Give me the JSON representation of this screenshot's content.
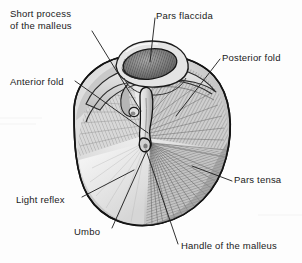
{
  "figure": {
    "background_color": "#fdfdfd",
    "ink_color": "#1a1a1a",
    "width": 302,
    "height": 263
  },
  "labels": [
    {
      "id": "short-process-of-the-malleus",
      "text": "Short process\nof the malleus",
      "x": 10,
      "y": 8,
      "lines": 2
    },
    {
      "id": "pars-flaccida",
      "text": "Pars flaccida",
      "x": 156,
      "y": 10,
      "lines": 1
    },
    {
      "id": "posterior-fold",
      "text": "Posterior fold",
      "x": 222,
      "y": 52,
      "lines": 1
    },
    {
      "id": "anterior-fold",
      "text": "Anterior fold",
      "x": 10,
      "y": 76,
      "lines": 1
    },
    {
      "id": "pars-tensa",
      "text": "Pars tensa",
      "x": 234,
      "y": 174,
      "lines": 1
    },
    {
      "id": "light-reflex",
      "text": "Light reflex",
      "x": 16,
      "y": 194,
      "lines": 1
    },
    {
      "id": "umbo",
      "text": "Umbo",
      "x": 74,
      "y": 226,
      "lines": 1
    },
    {
      "id": "handle-of-the-malleus",
      "text": "Handle of the malleus",
      "x": 181,
      "y": 240,
      "lines": 1
    }
  ],
  "structures": [
    {
      "id": "tympanic-membrane",
      "name": "Tympanic membrane outline"
    },
    {
      "id": "pars-flaccida-pocket",
      "name": "Pars flaccida (Shrapnell's membrane)"
    },
    {
      "id": "anterior-malleolar-fold",
      "name": "Anterior malleolar fold"
    },
    {
      "id": "posterior-malleolar-fold",
      "name": "Posterior malleolar fold"
    },
    {
      "id": "malleus-handle",
      "name": "Handle of the malleus (manubrium)"
    },
    {
      "id": "umbo-point",
      "name": "Umbo"
    },
    {
      "id": "cone-of-light",
      "name": "Light reflex / cone of light"
    },
    {
      "id": "pars-tensa-region",
      "name": "Pars tensa"
    }
  ],
  "palette": {
    "outline": "#141414",
    "membrane_light": "#e9e9e9",
    "membrane_mid": "#c9c9c9",
    "membrane_shadow": "#9a9a9a",
    "pocket_dark": "#6b6b6b",
    "highlight": "#f4f4f4",
    "leader_line": "#1a1a1a"
  }
}
